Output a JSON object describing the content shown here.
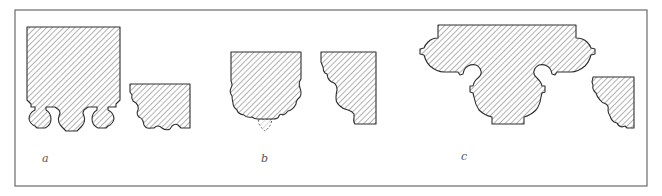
{
  "figure": {
    "colors": {
      "frame": "#6a6a6a",
      "outline": "#2e2e2e",
      "hatch": "#555555",
      "background": "#ffffff"
    },
    "panels": [
      {
        "id": "a",
        "label": "a",
        "shapes": [
          "column-base-with-three-lobed-bottom",
          "corner-molding-profile"
        ]
      },
      {
        "id": "b",
        "label": "b",
        "shapes": [
          "rectangular-block-with-scalloped-bottom-and-dashed-pendant",
          "stepped-corner-molding-profile"
        ]
      },
      {
        "id": "c",
        "label": "c",
        "shapes": [
          "wide-capital-with-lobed-sides-and-central-drop",
          "small-corner-molding-profile"
        ]
      }
    ]
  }
}
